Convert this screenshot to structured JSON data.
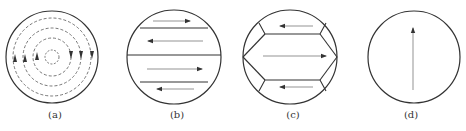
{
  "figure": {
    "panels": [
      {
        "label": "(a)",
        "description": "concentric dashed circulation lines with arrows"
      },
      {
        "label": "(b)",
        "description": "horizontal bands with alternating arrows"
      },
      {
        "label": "(c)",
        "description": "polygonal domains with alternating arrows"
      },
      {
        "label": "(d)",
        "description": "single vertical upward arrow"
      }
    ]
  },
  "colors": {
    "stroke": "#333333",
    "arrow": "#555555"
  }
}
